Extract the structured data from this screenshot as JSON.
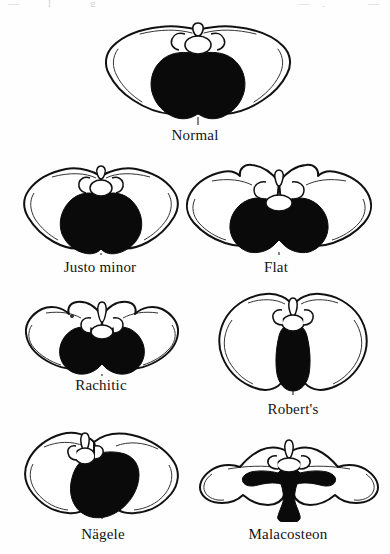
{
  "plate": {
    "title": "Comparative pelvic inlet types",
    "page_background": "#fefefe",
    "ink_color": "#111111",
    "inlet_fill_color": "#0a0a0a",
    "bone_fill_color": "#ffffff",
    "top_edge_artifacts": [
      "—",
      "l",
      "g",
      "—",
      ",",
      "—"
    ],
    "figure_count": 7
  },
  "figures": [
    {
      "id": "normal",
      "label": "Normal",
      "row": 1,
      "description": "Gynecoid pelvis with rounded, slightly transverse-oval inlet",
      "inlet_shape": "rounded-heart",
      "label_center_x": 196,
      "label_y": 128
    },
    {
      "id": "justo-minor",
      "label": "Justo minor",
      "row": 2,
      "description": "Generally contracted pelvis, normal shape reduced in all diameters",
      "inlet_shape": "small-heart",
      "label_center_x": 100,
      "label_y": 260
    },
    {
      "id": "flat",
      "label": "Flat",
      "row": 2,
      "description": "Simple flat pelvis with shortened anteroposterior diameter",
      "inlet_shape": "wide-transverse-kidney",
      "label_center_x": 275,
      "label_y": 260
    },
    {
      "id": "rachitic",
      "label": "Rachitic",
      "row": 3,
      "description": "Rachitic flat pelvis, promontory pushed forward, inlet reniform",
      "inlet_shape": "flattened-reniform",
      "label_center_x": 101,
      "label_y": 378
    },
    {
      "id": "roberts",
      "label": "Robert's",
      "row": 3,
      "description": "Transversely contracted pelvis with narrow slit-like inlet",
      "inlet_shape": "narrow-vertical-wedge",
      "label_center_x": 293,
      "label_y": 402
    },
    {
      "id": "nagele",
      "label": "Nägele",
      "row": 4,
      "description": "Obliquely contracted pelvis, asymmetric inlet displaced to one side",
      "inlet_shape": "oblique-oval",
      "label_center_x": 103,
      "label_y": 527
    },
    {
      "id": "malacosteon",
      "label": "Malacosteon",
      "row": 4,
      "description": "Osteomalacic pelvis with beaked trefoil inlet",
      "inlet_shape": "trefoil-beaked",
      "label_center_x": 288,
      "label_y": 527
    }
  ]
}
